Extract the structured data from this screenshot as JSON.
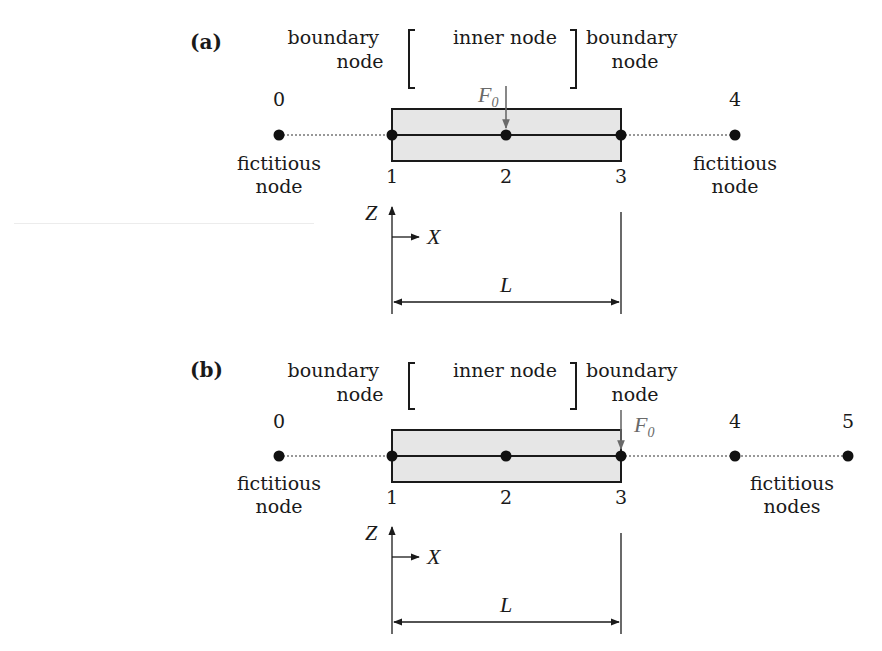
{
  "colors": {
    "ink": "#1a1a1a",
    "beam_fill": "#e6e6e6",
    "force_arrow": "#6a6a6a"
  },
  "panels": [
    {
      "label": "(a)",
      "annotations": {
        "left_boundary": [
          "boundary",
          "node"
        ],
        "inner": "inner node",
        "right_boundary": [
          "boundary",
          "node"
        ]
      },
      "force": {
        "symbol": "F",
        "subscript": "0",
        "at_node": "2"
      },
      "nodes": [
        {
          "id": "0",
          "type": "fictitious"
        },
        {
          "id": "1",
          "type": "boundary"
        },
        {
          "id": "2",
          "type": "inner"
        },
        {
          "id": "3",
          "type": "boundary"
        },
        {
          "id": "4",
          "type": "fictitious"
        }
      ],
      "fictitious_labels": {
        "left": [
          "fictitious",
          "node"
        ],
        "right": [
          "fictitious",
          "node"
        ]
      },
      "axes": {
        "z": "Z",
        "x": "X"
      },
      "dimension": "L"
    },
    {
      "label": "(b)",
      "annotations": {
        "left_boundary": [
          "boundary",
          "node"
        ],
        "inner": "inner node",
        "right_boundary": [
          "boundary",
          "node"
        ]
      },
      "force": {
        "symbol": "F",
        "subscript": "0",
        "at_node": "3"
      },
      "nodes": [
        {
          "id": "0",
          "type": "fictitious"
        },
        {
          "id": "1",
          "type": "boundary"
        },
        {
          "id": "2",
          "type": "inner"
        },
        {
          "id": "3",
          "type": "boundary"
        },
        {
          "id": "4",
          "type": "fictitious"
        },
        {
          "id": "5",
          "type": "fictitious"
        }
      ],
      "fictitious_labels": {
        "left": [
          "fictitious",
          "node"
        ],
        "right": [
          "fictitious",
          "nodes"
        ]
      },
      "axes": {
        "z": "Z",
        "x": "X"
      },
      "dimension": "L"
    }
  ]
}
